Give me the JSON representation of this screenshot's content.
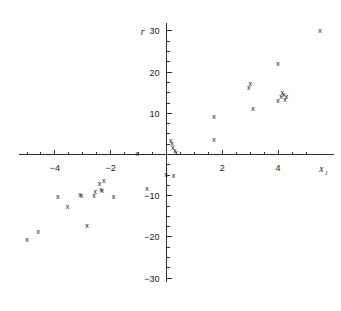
{
  "chart_data": {
    "type": "scatter",
    "title": "",
    "xlabel": "x1",
    "ylabel": "r",
    "xlim": [
      -5.3,
      6.0
    ],
    "ylim": [
      -31,
      32
    ],
    "grid": false,
    "legend": null,
    "marker": "x",
    "xticks": [
      -5,
      -4.5,
      -4,
      -3.5,
      -3,
      -2.5,
      -2,
      -1.5,
      -1,
      -0.5,
      0.5,
      1,
      1.5,
      2,
      2.5,
      3,
      3.5,
      4,
      4.5,
      5
    ],
    "xtick_labels": [
      {
        "value": -4,
        "label": "-4"
      },
      {
        "value": -2,
        "label": "-2"
      },
      {
        "value": 2,
        "label": "2"
      },
      {
        "value": 4,
        "label": "4"
      }
    ],
    "yticks": [
      -30,
      -27.5,
      -25,
      -22.5,
      -20,
      -17.5,
      -15,
      -12.5,
      -10,
      -7.5,
      -5,
      -2.5,
      2.5,
      5,
      7.5,
      10,
      12.5,
      15,
      17.5,
      20,
      22.5,
      25,
      27.5,
      30
    ],
    "ytick_labels": [
      {
        "value": 30,
        "label": "30"
      },
      {
        "value": 20,
        "label": "20"
      },
      {
        "value": 10,
        "label": "10"
      },
      {
        "value": -10,
        "label": "-10"
      },
      {
        "value": -20,
        "label": "-20"
      },
      {
        "value": -30,
        "label": "-30"
      }
    ],
    "points": [
      {
        "x": 5.5,
        "y": 30.0
      },
      {
        "x": 4.0,
        "y": 22.0
      },
      {
        "x": 3.0,
        "y": 17.0
      },
      {
        "x": 2.95,
        "y": 16.0
      },
      {
        "x": 4.15,
        "y": 15.0
      },
      {
        "x": 4.2,
        "y": 14.5
      },
      {
        "x": 4.3,
        "y": 14.0
      },
      {
        "x": 4.1,
        "y": 13.8
      },
      {
        "x": 4.25,
        "y": 13.2
      },
      {
        "x": 4.0,
        "y": 13.0
      },
      {
        "x": 3.1,
        "y": 11.0
      },
      {
        "x": 1.7,
        "y": 9.0
      },
      {
        "x": 1.7,
        "y": 3.5
      },
      {
        "x": 0.15,
        "y": 3.2
      },
      {
        "x": 0.2,
        "y": 2.4
      },
      {
        "x": 0.22,
        "y": 1.6
      },
      {
        "x": 0.3,
        "y": 0.8
      },
      {
        "x": 0.35,
        "y": 0.3
      },
      {
        "x": -1.05,
        "y": 0.0
      },
      {
        "x": -0.02,
        "y": -5.0
      },
      {
        "x": 0.25,
        "y": -5.2
      },
      {
        "x": -2.25,
        "y": -6.5
      },
      {
        "x": -2.4,
        "y": -7.2
      },
      {
        "x": -0.7,
        "y": -8.5
      },
      {
        "x": -2.35,
        "y": -8.6
      },
      {
        "x": -2.3,
        "y": -9.0
      },
      {
        "x": -2.55,
        "y": -9.2
      },
      {
        "x": -3.1,
        "y": -9.8
      },
      {
        "x": -3.05,
        "y": -10.0
      },
      {
        "x": -2.6,
        "y": -10.2
      },
      {
        "x": -1.9,
        "y": -10.3
      },
      {
        "x": -3.9,
        "y": -10.4
      },
      {
        "x": -3.55,
        "y": -12.8
      },
      {
        "x": -2.85,
        "y": -17.5
      },
      {
        "x": -4.6,
        "y": -18.8
      },
      {
        "x": -5.0,
        "y": -20.8
      }
    ]
  },
  "axes": {
    "y_label_text": "r",
    "x_label_base": "x",
    "x_label_subscript": "1"
  }
}
